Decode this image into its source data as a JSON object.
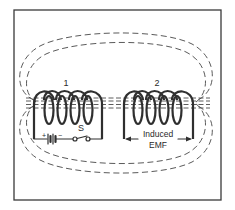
{
  "diagram": {
    "coil1": {
      "label": "1"
    },
    "coil2": {
      "label": "2"
    },
    "switch": {
      "label": "S"
    },
    "battery": {
      "plus": "+",
      "minus": "−"
    },
    "emf": {
      "line1": "Induced",
      "line2": "EMF"
    },
    "colors": {
      "line": "#2f2f2f",
      "field": "#5a5a5a",
      "background": "#ffffff",
      "frame": "#3a3a3a"
    }
  }
}
